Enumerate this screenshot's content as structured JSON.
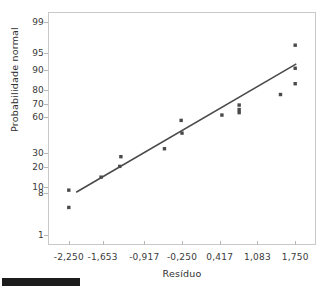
{
  "chart_data": {
    "type": "scatter",
    "title": "",
    "subtitle": "",
    "xlabel": "Resíduo",
    "ylabel": "Probabilidade normal",
    "decimal_separator": ",",
    "grid": false,
    "legend": null,
    "y_scale": "normal-probability",
    "xlim": [
      -2.6,
      2.1
    ],
    "ylim_percent": [
      0.6,
      99.4
    ],
    "x_ticks": [
      -2.25,
      -1.653,
      -0.917,
      -0.25,
      0.417,
      1.083,
      1.75
    ],
    "x_tick_labels": [
      "-2,250",
      "-1,653",
      "-0,917",
      "-0,250",
      "0,417",
      "1,083",
      "1,750"
    ],
    "y_ticks": [
      99,
      95,
      90,
      80,
      70,
      60,
      30,
      20,
      10,
      8,
      1
    ],
    "y_tick_labels": [
      "99",
      "95",
      "90",
      "80",
      "70",
      "60",
      "30",
      "20",
      "10",
      "8",
      "1"
    ],
    "series": [
      {
        "name": "Resíduos",
        "type": "scatter",
        "marker": "square",
        "color": "#4a4a4a",
        "points": [
          {
            "x": -2.25,
            "y": 9.0
          },
          {
            "x": -2.25,
            "y": 4.3
          },
          {
            "x": -1.68,
            "y": 14.5
          },
          {
            "x": -1.33,
            "y": 27.0
          },
          {
            "x": -1.35,
            "y": 20.5
          },
          {
            "x": -0.56,
            "y": 33.0
          },
          {
            "x": -0.265,
            "y": 57.0
          },
          {
            "x": -0.25,
            "y": 46.0
          },
          {
            "x": 0.455,
            "y": 61.5
          },
          {
            "x": 0.76,
            "y": 69.5
          },
          {
            "x": 0.76,
            "y": 66.0
          },
          {
            "x": 0.76,
            "y": 63.5
          },
          {
            "x": 1.49,
            "y": 77.0
          },
          {
            "x": 1.75,
            "y": 96.5
          },
          {
            "x": 1.75,
            "y": 90.5
          },
          {
            "x": 1.75,
            "y": 83.5
          }
        ]
      },
      {
        "name": "Linha de referência",
        "type": "line",
        "color": "#4a4a4a",
        "endpoints": [
          {
            "x": -2.12,
            "y": 8.3
          },
          {
            "x": 1.77,
            "y": 92.0
          }
        ]
      }
    ]
  },
  "axes": {
    "y_title": "Probabilidade normal",
    "x_title": "Resíduo"
  }
}
